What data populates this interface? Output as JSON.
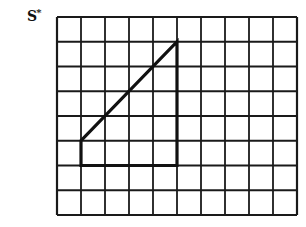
{
  "figure": {
    "label_main": "S",
    "label_sup": "*",
    "colors": {
      "grid": "#1a1a1a",
      "shape": "#111111",
      "background": "#ffffff"
    }
  },
  "grid": {
    "columns": 10,
    "rows": 8,
    "origin_px": [
      57,
      17
    ],
    "cell_w": 24,
    "cell_h": 24.75
  },
  "shape": {
    "type": "polygon",
    "vertices_grid": [
      [
        1,
        5
      ],
      [
        1,
        6
      ],
      [
        5,
        6
      ],
      [
        5,
        1
      ]
    ]
  }
}
